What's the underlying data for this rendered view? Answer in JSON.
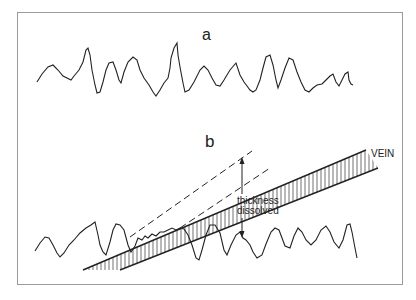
{
  "figure": {
    "panels": [
      {
        "label": "a",
        "description": "Irregular rough surface profile"
      },
      {
        "label": "b",
        "description": "Rough surface profile intersected by a dipping vein; dashed lines mark former vein position before dissolution"
      }
    ],
    "annotations": {
      "thickness_line1": "thickness",
      "thickness_line2": "dissolved",
      "vein": "VEIN"
    },
    "colors": {
      "line": "#222222",
      "frame": "#9a9a9a",
      "background": "#ffffff"
    }
  }
}
